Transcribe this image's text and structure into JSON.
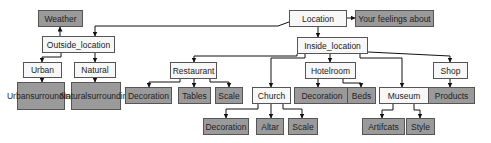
{
  "diagram": {
    "title": "",
    "colors": {
      "light_fill": "#f7f7f7",
      "dark_fill": "#9a9a9a",
      "border": "#555555",
      "edge": "#111111"
    },
    "nodes": [
      {
        "id": "location",
        "label": "Location",
        "style": "light",
        "x": 289,
        "y": 10,
        "w": 58,
        "h": 17
      },
      {
        "id": "feelings",
        "label": "Your feelings about",
        "style": "dark",
        "x": 355,
        "y": 10,
        "w": 79,
        "h": 17
      },
      {
        "id": "weather",
        "label": "Weather",
        "style": "dark",
        "x": 38,
        "y": 10,
        "w": 45,
        "h": 17
      },
      {
        "id": "outside",
        "label": "Outside_location",
        "style": "light",
        "x": 42,
        "y": 36,
        "w": 73,
        "h": 17
      },
      {
        "id": "urban",
        "label": "Urban",
        "style": "light",
        "x": 23,
        "y": 62,
        "w": 39,
        "h": 16
      },
      {
        "id": "natural",
        "label": "Natural",
        "style": "light",
        "x": 74,
        "y": 62,
        "w": 42,
        "h": 16
      },
      {
        "id": "urban_sur",
        "label": "Urban surrounding",
        "style": "dark",
        "x": 17,
        "y": 82,
        "w": 48,
        "h": 28
      },
      {
        "id": "natural_sur",
        "label": "Natural surrounding",
        "style": "dark",
        "x": 71,
        "y": 82,
        "w": 50,
        "h": 28
      },
      {
        "id": "inside",
        "label": "Inside_location",
        "style": "light",
        "x": 297,
        "y": 37,
        "w": 71,
        "h": 17
      },
      {
        "id": "restaurant",
        "label": "Restaurant",
        "style": "light",
        "x": 170,
        "y": 62,
        "w": 47,
        "h": 17
      },
      {
        "id": "rest_deco",
        "label": "Decoration",
        "style": "dark",
        "x": 125,
        "y": 87,
        "w": 47,
        "h": 17
      },
      {
        "id": "tables",
        "label": "Tables",
        "style": "dark",
        "x": 178,
        "y": 87,
        "w": 33,
        "h": 17
      },
      {
        "id": "rest_scale",
        "label": "Scale",
        "style": "dark",
        "x": 215,
        "y": 87,
        "w": 28,
        "h": 17
      },
      {
        "id": "church",
        "label": "Church",
        "style": "light",
        "x": 252,
        "y": 87,
        "w": 39,
        "h": 17
      },
      {
        "id": "hotelroom",
        "label": "Hotelroom",
        "style": "light",
        "x": 305,
        "y": 62,
        "w": 51,
        "h": 17
      },
      {
        "id": "hotel_deco",
        "label": "Decoration",
        "style": "dark",
        "x": 294,
        "y": 87,
        "w": 56,
        "h": 17
      },
      {
        "id": "beds",
        "label": "Beds",
        "style": "dark",
        "x": 347,
        "y": 87,
        "w": 29,
        "h": 17
      },
      {
        "id": "museum",
        "label": "Museum",
        "style": "light",
        "x": 379,
        "y": 87,
        "w": 50,
        "h": 17
      },
      {
        "id": "shop",
        "label": "Shop",
        "style": "light",
        "x": 433,
        "y": 62,
        "w": 35,
        "h": 17
      },
      {
        "id": "products",
        "label": "Products",
        "style": "dark",
        "x": 428,
        "y": 87,
        "w": 47,
        "h": 17
      },
      {
        "id": "church_deco",
        "label": "Decoration",
        "style": "dark",
        "x": 203,
        "y": 118,
        "w": 46,
        "h": 17
      },
      {
        "id": "altar",
        "label": "Altar",
        "style": "dark",
        "x": 256,
        "y": 118,
        "w": 28,
        "h": 17
      },
      {
        "id": "church_scale",
        "label": "Scale",
        "style": "dark",
        "x": 288,
        "y": 118,
        "w": 30,
        "h": 17
      },
      {
        "id": "artifacts",
        "label": "Artifcats",
        "style": "dark",
        "x": 362,
        "y": 118,
        "w": 43,
        "h": 17
      },
      {
        "id": "style",
        "label": "Style",
        "style": "dark",
        "x": 406,
        "y": 118,
        "w": 29,
        "h": 17
      }
    ],
    "edges": [
      {
        "from": "location",
        "to": "feelings",
        "points": [
          [
            347,
            18
          ],
          [
            355,
            18
          ]
        ]
      },
      {
        "from": "location",
        "to": "outside",
        "points": [
          [
            289,
            22
          ],
          [
            278,
            26
          ],
          [
            95,
            26
          ],
          [
            95,
            36
          ]
        ]
      },
      {
        "from": "location",
        "to": "inside",
        "points": [
          [
            318,
            27
          ],
          [
            318,
            37
          ]
        ]
      },
      {
        "from": "outside",
        "to": "weather",
        "points": [
          [
            60,
            36
          ],
          [
            60,
            27
          ]
        ]
      },
      {
        "from": "outside",
        "to": "urban",
        "points": [
          [
            61,
            53
          ],
          [
            61,
            57
          ],
          [
            42,
            57
          ],
          [
            42,
            62
          ]
        ]
      },
      {
        "from": "outside",
        "to": "natural",
        "points": [
          [
            95,
            53
          ],
          [
            95,
            62
          ]
        ]
      },
      {
        "from": "urban",
        "to": "urban_sur",
        "points": [
          [
            42,
            78
          ],
          [
            42,
            82
          ]
        ]
      },
      {
        "from": "natural",
        "to": "natural_sur",
        "points": [
          [
            95,
            78
          ],
          [
            95,
            82
          ]
        ]
      },
      {
        "from": "inside",
        "to": "restaurant",
        "points": [
          [
            297,
            54
          ],
          [
            297,
            56
          ],
          [
            194,
            56
          ],
          [
            194,
            62
          ]
        ]
      },
      {
        "from": "inside",
        "to": "church",
        "points": [
          [
            305,
            54
          ],
          [
            305,
            58
          ],
          [
            271,
            58
          ],
          [
            271,
            87
          ]
        ]
      },
      {
        "from": "inside",
        "to": "hotelroom",
        "points": [
          [
            330,
            54
          ],
          [
            330,
            62
          ]
        ]
      },
      {
        "from": "inside",
        "to": "museum",
        "points": [
          [
            360,
            54
          ],
          [
            360,
            58
          ],
          [
            402,
            58
          ],
          [
            402,
            87
          ]
        ]
      },
      {
        "from": "inside",
        "to": "shop",
        "points": [
          [
            368,
            52
          ],
          [
            450,
            56
          ],
          [
            450,
            62
          ]
        ]
      },
      {
        "from": "restaurant",
        "to": "rest_deco",
        "points": [
          [
            180,
            79
          ],
          [
            180,
            82
          ],
          [
            149,
            82
          ],
          [
            149,
            87
          ]
        ]
      },
      {
        "from": "restaurant",
        "to": "tables",
        "points": [
          [
            194,
            79
          ],
          [
            194,
            87
          ]
        ]
      },
      {
        "from": "restaurant",
        "to": "rest_scale",
        "points": [
          [
            210,
            79
          ],
          [
            210,
            82
          ],
          [
            229,
            82
          ],
          [
            229,
            87
          ]
        ]
      },
      {
        "from": "hotelroom",
        "to": "hotel_deco",
        "points": [
          [
            318,
            79
          ],
          [
            318,
            87
          ]
        ]
      },
      {
        "from": "hotelroom",
        "to": "beds",
        "points": [
          [
            343,
            79
          ],
          [
            343,
            83
          ],
          [
            361,
            83
          ],
          [
            361,
            87
          ]
        ]
      },
      {
        "from": "shop",
        "to": "products",
        "points": [
          [
            450,
            79
          ],
          [
            450,
            87
          ]
        ]
      },
      {
        "from": "church",
        "to": "church_deco",
        "points": [
          [
            258,
            104
          ],
          [
            258,
            109
          ],
          [
            226,
            109
          ],
          [
            226,
            118
          ]
        ]
      },
      {
        "from": "church",
        "to": "altar",
        "points": [
          [
            271,
            104
          ],
          [
            271,
            118
          ]
        ]
      },
      {
        "from": "church",
        "to": "church_scale",
        "points": [
          [
            283,
            104
          ],
          [
            283,
            109
          ],
          [
            302,
            109
          ],
          [
            302,
            118
          ]
        ]
      },
      {
        "from": "museum",
        "to": "artifacts",
        "points": [
          [
            393,
            104
          ],
          [
            393,
            110
          ],
          [
            382,
            110
          ],
          [
            382,
            118
          ]
        ]
      },
      {
        "from": "museum",
        "to": "style",
        "points": [
          [
            414,
            104
          ],
          [
            414,
            110
          ],
          [
            420,
            110
          ],
          [
            420,
            118
          ]
        ]
      }
    ]
  }
}
